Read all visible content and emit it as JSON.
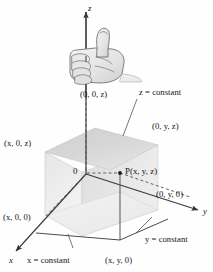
{
  "figure": {
    "axes": [
      {
        "name": "z-axis",
        "label": "z",
        "direction": "up"
      },
      {
        "name": "y-axis",
        "label": "y",
        "direction": "right"
      },
      {
        "name": "x-axis",
        "label": "x",
        "direction": "down-left"
      }
    ],
    "origin_label": "0",
    "point_label": "P(x, y, z)",
    "coordinate_labels": [
      {
        "name": "z-intercept",
        "text": "(0, 0, z)"
      },
      {
        "name": "xz-corner",
        "text": "(x, 0, z)"
      },
      {
        "name": "yz-corner",
        "text": "(0, y, z)"
      },
      {
        "name": "y-intercept",
        "text": "(0, y, 0)"
      },
      {
        "name": "x-intercept",
        "text": "(x, 0, 0)"
      },
      {
        "name": "xy-corner",
        "text": "(x, y, 0)"
      }
    ],
    "plane_labels": [
      {
        "name": "z-constant-plane",
        "text": "z = constant"
      },
      {
        "name": "y-constant-plane",
        "text": "y = constant"
      },
      {
        "name": "x-constant-plane",
        "text": "x = constant"
      }
    ],
    "hand": {
      "name": "right-hand-thumbs-up",
      "description": "right hand gripping z-axis, thumb up"
    },
    "colors": {
      "stroke": "#3a3a3a",
      "top_plane_fill": "#d0d0d0",
      "box_front_fill": "#ebebeb",
      "box_side_fill": "#e2e2e2",
      "box_base_fill": "#f0f0f0",
      "hand_fill": "#e8e8e8",
      "hand_stroke": "#565656",
      "background": "#ffffff"
    }
  }
}
